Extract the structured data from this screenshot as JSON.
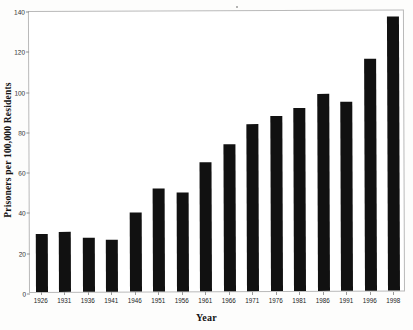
{
  "chart_data": {
    "type": "bar",
    "title": "",
    "xlabel": "Year",
    "ylabel": "Prisoners per 100,000 Residents",
    "categories": [
      "1926",
      "1931",
      "1936",
      "1941",
      "1946",
      "1951",
      "1956",
      "1961",
      "1966",
      "1971",
      "1976",
      "1981",
      "1986",
      "1991",
      "1996",
      "1998"
    ],
    "values": [
      29,
      30,
      27,
      26,
      39,
      51,
      49,
      64,
      73,
      83,
      87,
      91,
      98,
      94,
      115,
      136
    ],
    "ylim": [
      0,
      140
    ],
    "yticks": [
      0,
      20,
      40,
      60,
      80,
      100,
      120,
      140
    ],
    "ytick_labels": [
      "0",
      "20",
      "40",
      "60",
      "80",
      "100",
      "120",
      "140"
    ],
    "grid": false,
    "legend": "none",
    "bar_color": "#111111",
    "frame_color": "#b9b9b9",
    "background": "#ffffff"
  }
}
